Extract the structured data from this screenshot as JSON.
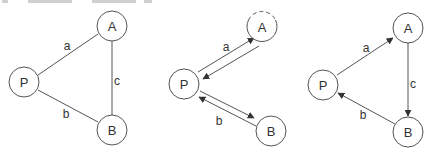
{
  "diagram": {
    "stroke_color": "#555555",
    "panels": [
      {
        "id": "undirected",
        "nodes": [
          {
            "id": "A",
            "label": "A",
            "cx": 112,
            "cy": 26
          },
          {
            "id": "P",
            "label": "P",
            "cx": 24,
            "cy": 82
          },
          {
            "id": "B",
            "label": "B",
            "cx": 112,
            "cy": 130
          }
        ],
        "edges": [
          {
            "from": "P",
            "to": "A",
            "label": "a",
            "directed": false
          },
          {
            "from": "P",
            "to": "B",
            "label": "b",
            "directed": false
          },
          {
            "from": "A",
            "to": "B",
            "label": "c",
            "directed": false
          }
        ]
      },
      {
        "id": "bidirectional",
        "nodes": [
          {
            "id": "A",
            "label": "A",
            "cx": 262,
            "cy": 27,
            "dashed_top": true
          },
          {
            "id": "P",
            "label": "P",
            "cx": 184,
            "cy": 84
          },
          {
            "id": "B",
            "label": "B",
            "cx": 271,
            "cy": 131
          }
        ],
        "edges": [
          {
            "from": "P",
            "to": "A",
            "label": "a",
            "directed": true
          },
          {
            "from": "A",
            "to": "P",
            "label": "",
            "directed": true
          },
          {
            "from": "P",
            "to": "B",
            "label": "",
            "directed": true
          },
          {
            "from": "B",
            "to": "P",
            "label": "b",
            "directed": true
          }
        ]
      },
      {
        "id": "cycle",
        "nodes": [
          {
            "id": "A",
            "label": "A",
            "cx": 408,
            "cy": 28
          },
          {
            "id": "P",
            "label": "P",
            "cx": 323,
            "cy": 85
          },
          {
            "id": "B",
            "label": "B",
            "cx": 408,
            "cy": 132
          }
        ],
        "edges": [
          {
            "from": "P",
            "to": "A",
            "label": "a",
            "directed": true
          },
          {
            "from": "A",
            "to": "B",
            "label": "c",
            "directed": true
          },
          {
            "from": "B",
            "to": "P",
            "label": "b",
            "directed": true
          }
        ]
      }
    ],
    "labels": {
      "p1": {
        "A": "A",
        "P": "P",
        "B": "B",
        "a": "a",
        "b": "b",
        "c": "c"
      },
      "p2": {
        "A": "A",
        "P": "P",
        "B": "B",
        "a": "a",
        "b": "b"
      },
      "p3": {
        "A": "A",
        "P": "P",
        "B": "B",
        "a": "a",
        "b": "b",
        "c": "c"
      }
    }
  }
}
